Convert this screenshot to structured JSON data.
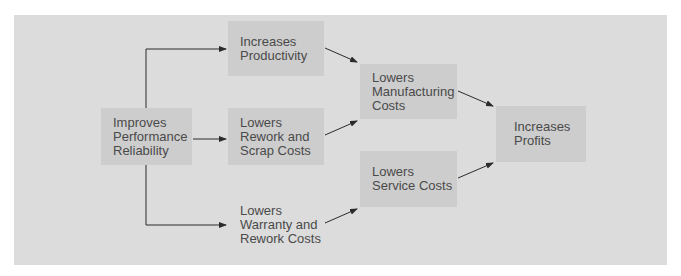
{
  "diagram": {
    "type": "flowchart",
    "colors": {
      "panel": "#dcdcdc",
      "node": "#cdcdcd",
      "text": "#4a4a4a",
      "arrow": "#2b2b2b"
    },
    "nodes": {
      "improves_reliability": {
        "lines": [
          "Improves",
          "Performance",
          "Reliability"
        ]
      },
      "increases_productivity": {
        "lines": [
          "Increases",
          "Productivity"
        ]
      },
      "lowers_rework_scrap": {
        "lines": [
          "Lowers",
          "Rework and",
          "Scrap Costs"
        ]
      },
      "lowers_warranty_rework": {
        "lines": [
          "Lowers",
          "Warranty and",
          "Rework Costs"
        ]
      },
      "lowers_manufacturing": {
        "lines": [
          "Lowers",
          "Manufacturing",
          "Costs"
        ]
      },
      "lowers_service": {
        "lines": [
          "Lowers",
          "Service Costs"
        ]
      },
      "increases_profits": {
        "lines": [
          "Increases",
          "Profits"
        ]
      }
    },
    "edges": [
      {
        "from": "Improves Performance Reliability",
        "to": "Increases Productivity"
      },
      {
        "from": "Improves Performance Reliability",
        "to": "Lowers Rework and Scrap Costs"
      },
      {
        "from": "Improves Performance Reliability",
        "to": "Lowers Warranty and Rework Costs"
      },
      {
        "from": "Increases Productivity",
        "to": "Lowers Manufacturing Costs"
      },
      {
        "from": "Lowers Rework and Scrap Costs",
        "to": "Lowers Manufacturing Costs"
      },
      {
        "from": "Lowers Warranty and Rework Costs",
        "to": "Lowers Service Costs"
      },
      {
        "from": "Lowers Manufacturing Costs",
        "to": "Increases Profits"
      },
      {
        "from": "Lowers Service Costs",
        "to": "Increases Profits"
      }
    ]
  }
}
